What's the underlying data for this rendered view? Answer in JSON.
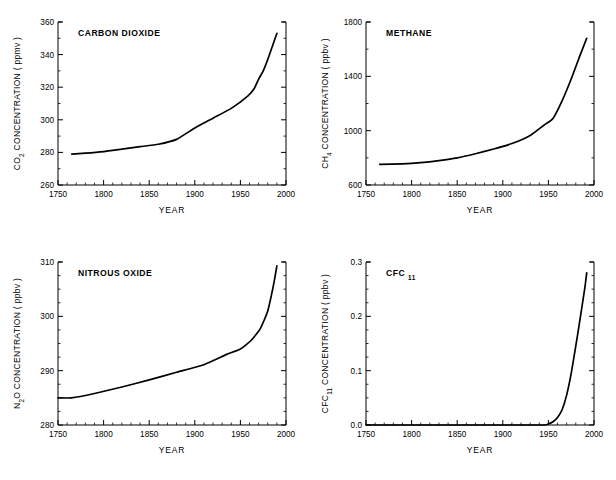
{
  "figure": {
    "background": "#ffffff",
    "line_color": "#000000",
    "axis_color": "#000000"
  },
  "chart_data": [
    {
      "type": "line",
      "title": "CARBON DIOXIDE",
      "title_html": "CARBON DIOXIDE",
      "xlabel": "YEAR",
      "ylabel": "CO2 CONCENTRATION ( ppmv )",
      "ylabel_main": "CONCENTRATION ( ppmv )",
      "ylabel_species": "CO",
      "ylabel_sub": "2",
      "units": "ppmv",
      "xlim": [
        1750,
        2000
      ],
      "ylim": [
        260,
        360
      ],
      "xticks": [
        1750,
        1800,
        1850,
        1900,
        1950,
        2000
      ],
      "yticks": [
        260,
        280,
        300,
        320,
        340,
        360
      ],
      "xminor_step": 10,
      "yminor_step": 10,
      "grid": false,
      "legend": "none",
      "x": [
        1765,
        1780,
        1800,
        1820,
        1840,
        1860,
        1880,
        1900,
        1920,
        1940,
        1958,
        1965,
        1970,
        1975,
        1980,
        1985,
        1990
      ],
      "values": [
        279,
        279.5,
        280.5,
        282,
        283.5,
        285,
        288,
        295,
        301,
        307,
        314.5,
        319,
        325,
        330,
        337,
        345,
        353
      ]
    },
    {
      "type": "line",
      "title": "METHANE",
      "title_html": "METHANE",
      "xlabel": "YEAR",
      "ylabel": "CH4 CONCENTRATION ( ppbv )",
      "ylabel_main": "CONCENTRATION ( ppbv )",
      "ylabel_species": "CH",
      "ylabel_sub": "4",
      "units": "ppbv",
      "xlim": [
        1750,
        2000
      ],
      "ylim": [
        600,
        1800
      ],
      "xticks": [
        1750,
        1800,
        1850,
        1900,
        1950,
        2000
      ],
      "yticks": [
        600,
        1000,
        1400,
        1800
      ],
      "xminor_step": 10,
      "yminor_step": 200,
      "grid": false,
      "legend": "none",
      "x": [
        1765,
        1790,
        1810,
        1830,
        1850,
        1870,
        1890,
        1910,
        1930,
        1945,
        1955,
        1965,
        1975,
        1985,
        1992
      ],
      "values": [
        752,
        756,
        765,
        780,
        800,
        830,
        865,
        905,
        965,
        1040,
        1090,
        1220,
        1380,
        1560,
        1680
      ]
    },
    {
      "type": "line",
      "title": "NITROUS OXIDE",
      "title_html": "NITROUS OXIDE",
      "xlabel": "YEAR",
      "ylabel": "N2O CONCENTRATION ( ppbv )",
      "ylabel_main": "CONCENTRATION ( ppbv )",
      "ylabel_species": "N",
      "ylabel_sub": "2",
      "ylabel_species_tail": "O",
      "units": "ppbv",
      "xlim": [
        1750,
        2000
      ],
      "ylim": [
        280,
        310
      ],
      "xticks": [
        1750,
        1800,
        1850,
        1900,
        1950,
        2000
      ],
      "yticks": [
        280,
        290,
        300,
        310
      ],
      "xminor_step": 10,
      "yminor_step": 2.5,
      "grid": false,
      "legend": "none",
      "x": [
        1750,
        1765,
        1790,
        1820,
        1850,
        1880,
        1910,
        1935,
        1950,
        1962,
        1972,
        1980,
        1986,
        1990
      ],
      "values": [
        285,
        285,
        285.8,
        287,
        288.3,
        289.7,
        291.1,
        293,
        294,
        295.6,
        297.8,
        301,
        305.5,
        309.3
      ]
    },
    {
      "type": "line",
      "title": "CFC 11",
      "title_html": "CFC<sub>11</sub>",
      "title_main": "CFC",
      "title_sub": "11",
      "xlabel": "YEAR",
      "ylabel": "CFC11 CONCENTRATION ( ppbv )",
      "ylabel_main": "CONCENTRATION ( ppbv )",
      "ylabel_species": "CFC",
      "ylabel_sub": "11",
      "units": "ppbv",
      "xlim": [
        1750,
        2000
      ],
      "ylim": [
        0.0,
        0.3
      ],
      "xticks": [
        1750,
        1800,
        1850,
        1900,
        1950,
        2000
      ],
      "yticks": [
        "0.0",
        "0.1",
        "0.2",
        "0.3"
      ],
      "ytick_values": [
        0.0,
        0.1,
        0.2,
        0.3
      ],
      "xminor_step": 10,
      "yminor_step": 0.025,
      "grid": false,
      "legend": "none",
      "x": [
        1750,
        1900,
        1945,
        1950,
        1955,
        1960,
        1965,
        1970,
        1975,
        1980,
        1985,
        1990,
        1992
      ],
      "values": [
        0.0,
        0.0,
        0.0,
        0.002,
        0.006,
        0.014,
        0.028,
        0.055,
        0.095,
        0.145,
        0.198,
        0.253,
        0.28
      ]
    }
  ]
}
